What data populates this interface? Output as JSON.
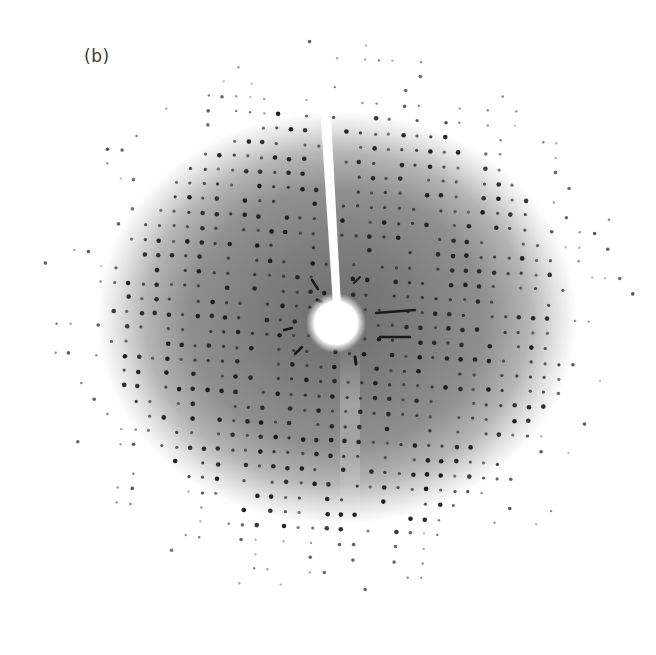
{
  "figure": {
    "panel_label": "(b)",
    "colors": {
      "background": "#ffffff",
      "halo_center": "#7a7a7a",
      "halo_mid": "#9a9a9a",
      "halo_edge": "#ffffff",
      "spot": "#1a1a1a",
      "beam_stop": "#ffffff",
      "label": "#3a3a3a"
    },
    "pattern": {
      "center": [
        337,
        323
      ],
      "halo_radii": [
        235,
        205
      ],
      "beam_stop_radius": 22,
      "stick": {
        "top": [
          322,
          60
        ],
        "bottom": [
          337,
          305
        ],
        "width_top": 12,
        "width_bottom": 9
      },
      "lattice_spacing": 14,
      "lattice_angle_deg": 3,
      "spot_extent_radius": 300
    }
  }
}
